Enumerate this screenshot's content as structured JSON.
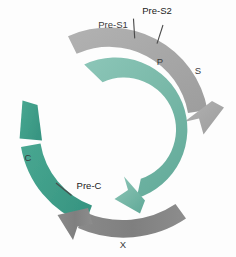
{
  "figure": {
    "name": "hbv-genome-orf-diagram",
    "background_color": "#fdfdfd",
    "width": 236,
    "height": 257
  },
  "palette": {
    "gray_light": "#a9a9a9",
    "gray_mid": "#9a9a9a",
    "gray_dark": "#7d7d7d",
    "teal_light": "#7fbdae",
    "teal_mid": "#6fb6a6",
    "teal_dark": "#3f9d88",
    "label_text": "#3a3a3a",
    "tick_line": "#4a4a4a"
  },
  "arcs": [
    {
      "id": "s-orf",
      "name": "s-orf-arc",
      "color": "#a9a9a9",
      "ring": "outer",
      "segments": [
        "Pre-S1",
        "Pre-S2",
        "S"
      ],
      "arrow": "clockwise-end-lower-right"
    },
    {
      "id": "p-orf",
      "name": "p-orf-arc",
      "color": "#7fbdae",
      "ring": "inner",
      "segments": [
        "P"
      ],
      "arrow": "clockwise-end-lower-center"
    },
    {
      "id": "c-orf",
      "name": "c-orf-arc",
      "color": "#3f9d88",
      "ring": "outer",
      "segments": [
        "Pre-C",
        "C"
      ],
      "arrow": "counterclockwise-end-upper-left"
    },
    {
      "id": "x-orf",
      "name": "x-orf-arc",
      "color": "#7d7d7d",
      "ring": "outer",
      "segments": [
        "X"
      ],
      "arrow": "counterclockwise-end-left"
    }
  ],
  "labels": {
    "pre_s1": "Pre-S1",
    "pre_s2": "Pre-S2",
    "s": "S",
    "p": "P",
    "c": "C",
    "pre_c": "Pre-C",
    "x": "X"
  }
}
